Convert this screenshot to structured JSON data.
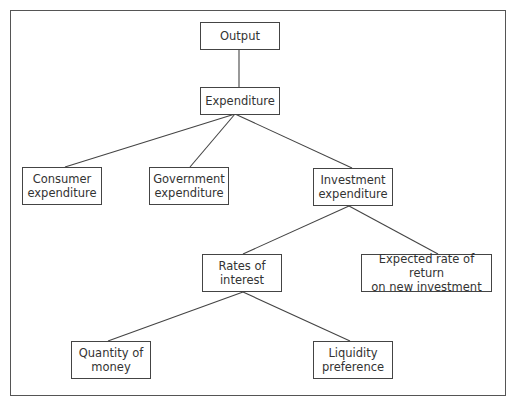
{
  "diagram": {
    "type": "tree",
    "nodes": [
      {
        "id": "output",
        "label": "Output",
        "x": 200,
        "y": 22,
        "w": 80,
        "h": 28
      },
      {
        "id": "expenditure",
        "label": "Expenditure",
        "x": 200,
        "y": 87,
        "w": 80,
        "h": 28
      },
      {
        "id": "consumer",
        "label": "Consumer\nexpenditure",
        "x": 22,
        "y": 167,
        "w": 80,
        "h": 38
      },
      {
        "id": "government",
        "label": "Government\nexpenditure",
        "x": 149,
        "y": 167,
        "w": 80,
        "h": 38
      },
      {
        "id": "investment",
        "label": "Investment\nexpenditure",
        "x": 313,
        "y": 168,
        "w": 80,
        "h": 38
      },
      {
        "id": "rates",
        "label": "Rates of\ninterest",
        "x": 202,
        "y": 254,
        "w": 80,
        "h": 38
      },
      {
        "id": "expected",
        "label": "Expected rate of return\non new investment",
        "x": 361,
        "y": 254,
        "w": 131,
        "h": 38
      },
      {
        "id": "quantity",
        "label": "Quantity of\nmoney",
        "x": 71,
        "y": 341,
        "w": 80,
        "h": 38
      },
      {
        "id": "liquidity",
        "label": "Liquidity\npreference",
        "x": 313,
        "y": 341,
        "w": 80,
        "h": 38
      }
    ],
    "edges": [
      {
        "from": "output",
        "to": "expenditure",
        "x1": 239,
        "y1": 50,
        "x2": 239,
        "y2": 87
      },
      {
        "from": "expenditure",
        "to": "consumer",
        "x1": 235,
        "y1": 114,
        "x2": 65,
        "y2": 167
      },
      {
        "from": "expenditure",
        "to": "government",
        "x1": 235,
        "y1": 114,
        "x2": 190,
        "y2": 167
      },
      {
        "from": "expenditure",
        "to": "investment",
        "x1": 235,
        "y1": 114,
        "x2": 352,
        "y2": 168
      },
      {
        "from": "investment",
        "to": "rates",
        "x1": 349,
        "y1": 206,
        "x2": 243,
        "y2": 254
      },
      {
        "from": "investment",
        "to": "expected",
        "x1": 349,
        "y1": 206,
        "x2": 438,
        "y2": 254
      },
      {
        "from": "rates",
        "to": "quantity",
        "x1": 243,
        "y1": 292,
        "x2": 108,
        "y2": 341
      },
      {
        "from": "rates",
        "to": "liquidity",
        "x1": 243,
        "y1": 292,
        "x2": 350,
        "y2": 341
      }
    ]
  }
}
